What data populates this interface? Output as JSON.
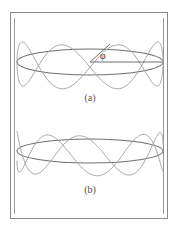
{
  "figure": {
    "panels": [
      {
        "id": "a",
        "label": "(a)",
        "description": "Standing wave on a ring with angle phi marked"
      },
      {
        "id": "b",
        "label": "(b)",
        "description": "Non-closing wave on a ring"
      }
    ],
    "angle_symbol": "φ"
  },
  "colors": {
    "frame": "#888888",
    "wave": "#a0a0a0",
    "ring": "#707070"
  }
}
